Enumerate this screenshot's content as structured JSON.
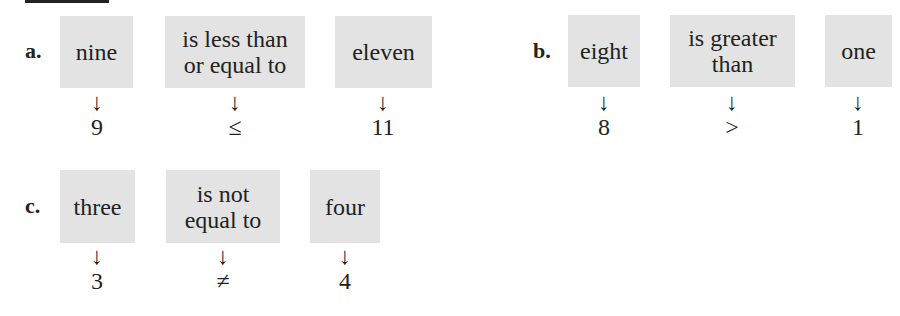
{
  "problems": [
    {
      "label": "a.",
      "items": [
        {
          "words": "nine",
          "symbol": "9"
        },
        {
          "words": "is less than or equal to",
          "line1": "is less than",
          "line2": "or equal to",
          "symbol": "≤"
        },
        {
          "words": "eleven",
          "symbol": "11"
        }
      ]
    },
    {
      "label": "b.",
      "items": [
        {
          "words": "eight",
          "symbol": "8"
        },
        {
          "words": "is greater than",
          "line1": "is greater",
          "line2": "than",
          "symbol": ">"
        },
        {
          "words": "one",
          "symbol": "1"
        }
      ]
    },
    {
      "label": "c.",
      "items": [
        {
          "words": "three",
          "symbol": "3"
        },
        {
          "words": "is not equal to",
          "line1": "is not",
          "line2": "equal to",
          "symbol": "≠"
        },
        {
          "words": "four",
          "symbol": "4"
        }
      ]
    }
  ],
  "arrow_glyph": "↓",
  "colors": {
    "box": "#e3e3e3",
    "text": "#222222"
  }
}
